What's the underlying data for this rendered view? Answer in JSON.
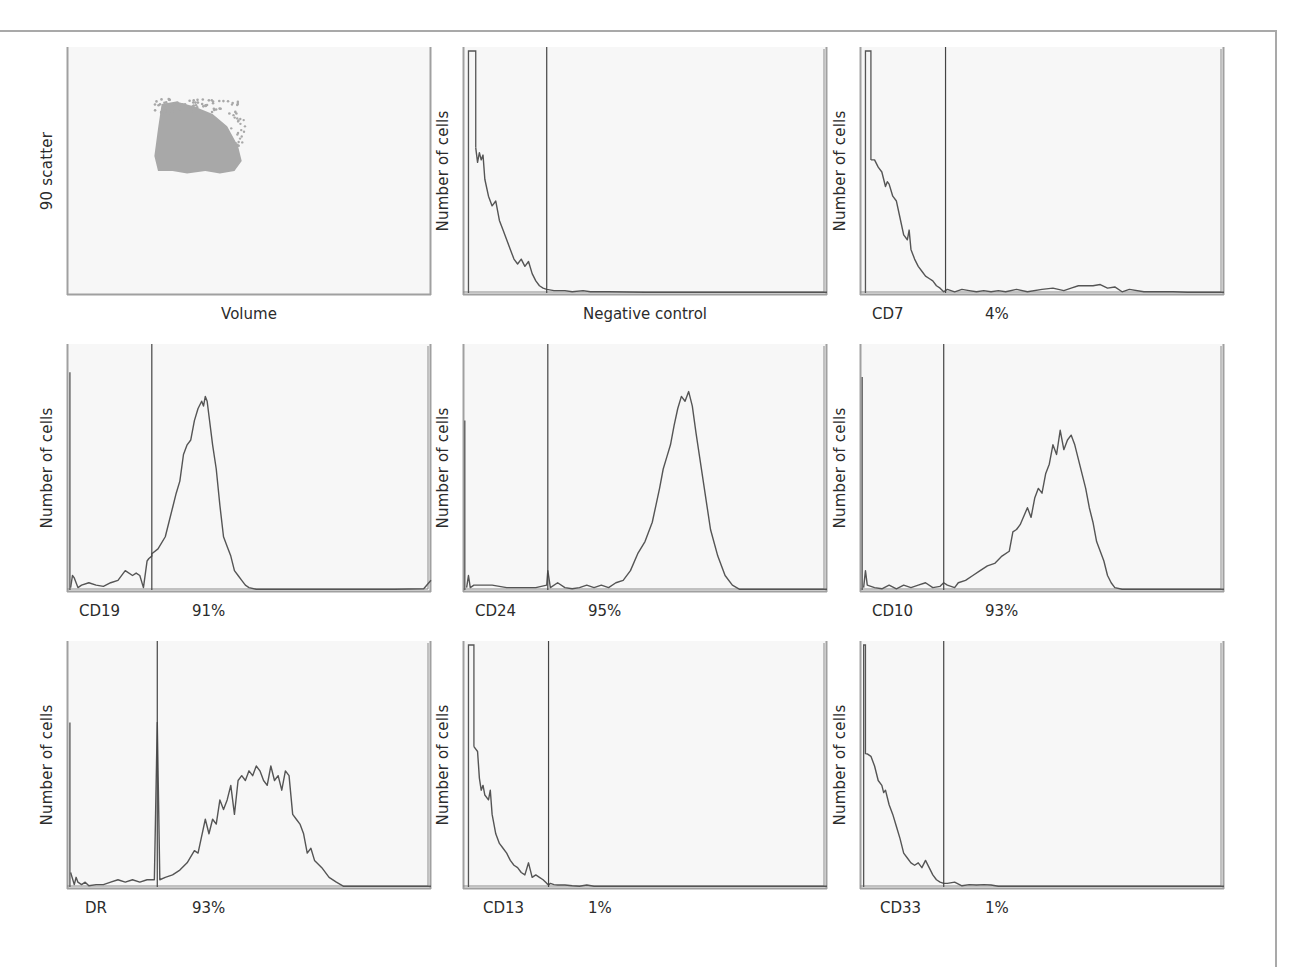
{
  "figure": {
    "line_color": "#555555",
    "axis_color": "#a0a0a0",
    "background_color": "#f7f7f7",
    "scatter_color": "#a8a8a8"
  },
  "chart_data": [
    {
      "id": "scatter",
      "type": "scatter",
      "title": "",
      "xlabel": "Volume",
      "ylabel": "90 scatter",
      "marker": "",
      "percent": "",
      "description": "Single dense cell population cluster at low-mid volume and low-mid 90° scatter",
      "cluster_bounds": {
        "x_min": 24,
        "x_max": 48,
        "y_min": 22,
        "y_max": 50
      },
      "cluster_outline": [
        [
          25,
          50
        ],
        [
          24,
          44
        ],
        [
          25,
          33
        ],
        [
          26,
          23
        ],
        [
          30,
          22
        ],
        [
          35,
          24
        ],
        [
          40,
          27
        ],
        [
          44,
          32
        ],
        [
          47,
          40
        ],
        [
          48,
          46
        ],
        [
          46,
          50
        ],
        [
          42,
          51
        ],
        [
          38,
          50
        ],
        [
          33,
          51
        ],
        [
          29,
          50
        ]
      ]
    },
    {
      "id": "negative-control",
      "type": "line",
      "xlabel": "Negative control",
      "ylabel": "Number of cells",
      "marker": "",
      "percent": "",
      "gate_x": 23,
      "spike": {
        "x": [
          1.5,
          3.5
        ],
        "y": 100
      },
      "x": [
        3.5,
        4,
        4.5,
        5,
        5.5,
        6,
        7,
        8,
        9,
        10,
        11,
        12,
        13,
        14,
        15,
        16,
        17,
        18,
        19,
        20,
        21,
        22,
        23,
        25,
        28,
        30,
        33,
        35,
        40,
        50,
        60,
        70,
        80,
        90,
        100
      ],
      "values": [
        60,
        54,
        58,
        55,
        57,
        47,
        40,
        36,
        38,
        30,
        26,
        22,
        18,
        14,
        12,
        14,
        11,
        13,
        8,
        5,
        3,
        2,
        1.5,
        1,
        1,
        0.5,
        1,
        0.5,
        0.5,
        0.3,
        0.3,
        0.3,
        0.3,
        0.3,
        0.3
      ]
    },
    {
      "id": "cd7",
      "type": "line",
      "xlabel": "",
      "ylabel": "Number of cells",
      "marker": "CD7",
      "percent": "4%",
      "gate_x": 23.5,
      "spike": {
        "x": [
          1.5,
          3
        ],
        "y": 100
      },
      "x": [
        3,
        4,
        5,
        6,
        7,
        7.5,
        8,
        9,
        10,
        11,
        12,
        13,
        13.5,
        14,
        15,
        16,
        17,
        18,
        19,
        20,
        21,
        22,
        23,
        24,
        26,
        28,
        30,
        32,
        34,
        36,
        38,
        40,
        43,
        46,
        50,
        53,
        56,
        58,
        60,
        62,
        64,
        66,
        68,
        70,
        72,
        74,
        78,
        82,
        86,
        90,
        100
      ],
      "values": [
        55,
        55,
        52,
        50,
        44,
        46,
        45,
        40,
        38,
        31,
        24,
        22,
        26,
        18,
        14,
        11,
        9,
        7,
        6,
        5,
        3,
        2,
        0.5,
        1.5,
        0.5,
        1.5,
        1,
        0.5,
        1,
        0.5,
        1,
        0.5,
        1.5,
        0.5,
        1.5,
        2,
        1,
        2,
        3,
        3,
        3,
        3.5,
        2,
        2.5,
        0.5,
        1.5,
        0.5,
        0.5,
        0.5,
        0.3,
        0.3
      ]
    },
    {
      "id": "cd19",
      "type": "line",
      "xlabel": "",
      "ylabel": "Number of cells",
      "marker": "CD19",
      "percent": "91%",
      "gate_x": 23.3,
      "spike": {
        "x": [
          0.8,
          0.8
        ],
        "y": 90
      },
      "x": [
        1,
        1.5,
        2,
        3,
        4,
        6,
        8,
        10,
        12,
        14,
        16,
        18,
        19,
        20,
        21,
        22,
        22.5,
        23.3,
        23.3,
        25,
        27,
        28,
        29,
        30,
        31,
        32,
        33,
        34,
        35,
        36,
        37,
        37.5,
        38,
        38.5,
        39,
        40,
        41,
        42,
        43,
        44,
        45,
        46,
        47,
        48,
        49,
        50,
        52,
        54,
        56,
        58,
        60,
        70,
        80,
        90,
        98,
        100
      ],
      "values": [
        1,
        6,
        5,
        1,
        2,
        3,
        2,
        1.5,
        3,
        4,
        8,
        6,
        7,
        6,
        1,
        12,
        13,
        14,
        15,
        17,
        22,
        28,
        34,
        40,
        45,
        56,
        60,
        62,
        70,
        75,
        78,
        76,
        80,
        78,
        72,
        60,
        50,
        35,
        22,
        18,
        14,
        8,
        6,
        4,
        2,
        1,
        0.3,
        0.3,
        0.3,
        0.3,
        0.3,
        0.3,
        0.3,
        0.3,
        0.5,
        4
      ]
    },
    {
      "id": "cd24",
      "type": "line",
      "xlabel": "",
      "ylabel": "Number of cells",
      "marker": "CD24",
      "percent": "95%",
      "gate_x": 23.3,
      "spike": {
        "x": [
          0.5,
          0.5
        ],
        "y": 70
      },
      "x": [
        1,
        1.5,
        2,
        3,
        5,
        8,
        12,
        16,
        20,
        23,
        23.3,
        24,
        26,
        28,
        30,
        32,
        34,
        36,
        38,
        40,
        42,
        44,
        46,
        48,
        50,
        52,
        53,
        54,
        55,
        56,
        57,
        58,
        59,
        60,
        61,
        62,
        63,
        64,
        65,
        66,
        67,
        68,
        70,
        72,
        74,
        76,
        78,
        80,
        90,
        100
      ],
      "values": [
        1,
        6,
        1,
        2,
        2,
        2,
        1,
        1,
        1,
        2,
        8,
        1,
        3,
        1,
        0.5,
        1,
        2,
        1,
        2,
        1,
        3,
        4,
        8,
        15,
        20,
        28,
        35,
        42,
        50,
        55,
        60,
        68,
        75,
        80,
        78,
        82,
        76,
        65,
        55,
        45,
        35,
        25,
        14,
        6,
        2,
        0.3,
        0.3,
        0.3,
        0.3,
        0.3
      ]
    },
    {
      "id": "cd10",
      "type": "line",
      "xlabel": "",
      "ylabel": "Number of cells",
      "marker": "CD10",
      "percent": "93%",
      "gate_x": 23,
      "spike": {
        "x": [
          0.6,
          0.6
        ],
        "y": 88
      },
      "x": [
        1,
        1.5,
        2,
        4,
        6,
        8,
        10,
        12,
        14,
        16,
        18,
        20,
        22,
        23,
        24,
        26,
        27,
        29,
        31,
        33,
        35,
        37,
        39,
        41,
        42,
        43,
        44,
        46,
        47,
        48,
        49,
        50,
        51,
        52,
        53,
        54,
        55,
        56,
        57,
        58,
        59,
        60,
        61,
        62,
        63,
        64,
        65,
        66,
        67,
        68,
        69,
        70,
        72,
        74,
        80,
        90,
        100
      ],
      "values": [
        1,
        8,
        2,
        1,
        0.5,
        2,
        0.5,
        2,
        1,
        2,
        3,
        1,
        1.5,
        3,
        2,
        1,
        3,
        4,
        6,
        8,
        10,
        11,
        14,
        16,
        24,
        25,
        27,
        34,
        30,
        38,
        42,
        40,
        48,
        52,
        60,
        56,
        66,
        58,
        62,
        64,
        60,
        54,
        48,
        42,
        34,
        28,
        20,
        16,
        12,
        6,
        3,
        1,
        0.3,
        0.3,
        0.3,
        0.3,
        0.3
      ]
    },
    {
      "id": "dr",
      "type": "line",
      "xlabel": "",
      "ylabel": "Number of cells",
      "marker": "DR",
      "percent": "93%",
      "gate_x": 24.8,
      "spike": {
        "x": [
          0.8,
          0.8
        ],
        "y": 68
      },
      "x": [
        1,
        2,
        2.5,
        3,
        4,
        5,
        6,
        8,
        10,
        12,
        14,
        16,
        18,
        20,
        22,
        24,
        24.8,
        25.5,
        27,
        29,
        31,
        33,
        35,
        36,
        37,
        38,
        39,
        40,
        41,
        42,
        43,
        44,
        45,
        46,
        47,
        48,
        49,
        50,
        51,
        52,
        53,
        54,
        55,
        56,
        57,
        58,
        59,
        60,
        61,
        62,
        63,
        64,
        65,
        66,
        67,
        68,
        70,
        72,
        74,
        76,
        78,
        80,
        82,
        85,
        90,
        100
      ],
      "values": [
        6,
        1,
        4,
        2,
        1,
        2,
        0.5,
        1,
        1,
        2,
        3,
        2,
        3,
        2,
        3,
        3,
        68,
        3,
        4,
        5,
        7,
        10,
        15,
        14,
        21,
        28,
        22,
        28,
        26,
        36,
        32,
        36,
        42,
        30,
        44,
        46,
        44,
        48,
        46,
        50,
        48,
        44,
        42,
        50,
        44,
        46,
        40,
        48,
        46,
        30,
        28,
        26,
        22,
        14,
        16,
        11,
        8,
        4,
        2,
        0.3,
        0.3,
        0.3,
        0.3,
        0.3,
        0.3,
        0.3
      ]
    },
    {
      "id": "cd13",
      "type": "line",
      "xlabel": "",
      "ylabel": "Number of cells",
      "marker": "CD13",
      "percent": "1%",
      "gate_x": 23.5,
      "spike": {
        "x": [
          1.5,
          3
        ],
        "y": 100
      },
      "x": [
        3,
        4,
        4.5,
        5,
        5.5,
        6,
        7,
        7.5,
        8,
        9,
        10,
        11,
        12,
        13,
        14,
        15,
        16,
        17,
        18,
        19,
        20,
        21,
        22,
        23,
        23.5,
        24,
        25,
        26,
        28,
        30,
        32,
        34,
        36,
        38,
        40,
        45,
        50,
        60,
        70,
        80,
        90,
        100
      ],
      "values": [
        58,
        56,
        45,
        40,
        42,
        38,
        36,
        40,
        30,
        22,
        18,
        16,
        14,
        11,
        9,
        8,
        6,
        5,
        10,
        4,
        5,
        4,
        3,
        1.5,
        0.8,
        1.5,
        1,
        0.8,
        0.8,
        0.5,
        0.3,
        0.8,
        0.3,
        0.3,
        0.3,
        0.3,
        0.3,
        0.3,
        0.3,
        0.3,
        0.3,
        0.3
      ]
    },
    {
      "id": "cd33",
      "type": "line",
      "xlabel": "",
      "ylabel": "Number of cells",
      "marker": "CD33",
      "percent": "1%",
      "gate_x": 23,
      "spike": {
        "x": [
          1,
          1.5
        ],
        "y": 100
      },
      "x": [
        1.5,
        2,
        3,
        4,
        5,
        6,
        6.5,
        7,
        8,
        9,
        10,
        11,
        12,
        13,
        14,
        15,
        16,
        17,
        18,
        19,
        20,
        21,
        22,
        23,
        24,
        26,
        28,
        30,
        32,
        34,
        36,
        38,
        40,
        45,
        50,
        60,
        70,
        80,
        90,
        100
      ],
      "values": [
        55,
        55,
        54,
        50,
        44,
        42,
        39,
        40,
        34,
        30,
        25,
        20,
        14,
        12,
        10,
        9,
        10,
        8,
        11,
        8,
        5,
        3,
        2,
        1.5,
        1.5,
        2,
        0.5,
        1,
        0.8,
        1,
        0.8,
        0.3,
        0.3,
        0.3,
        0.3,
        0.3,
        0.3,
        0.3,
        0.3,
        0.3
      ]
    }
  ],
  "layout": {
    "columns_left": [
      67,
      463,
      860
    ],
    "rows_top": [
      47,
      344,
      641
    ],
    "plot_width": 364,
    "plot_height": 248
  }
}
